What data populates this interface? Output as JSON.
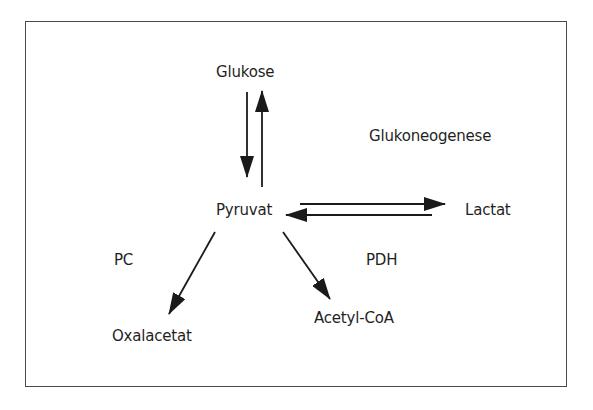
{
  "diagram": {
    "type": "metabolic-pathway",
    "nodes": {
      "glukose": "Glukose",
      "pyruvat": "Pyruvat",
      "lactat": "Lactat",
      "oxalacetat": "Oxalacetat",
      "acetyl_coa": "Acetyl-CoA"
    },
    "annotations": {
      "glukoneogenese": "Glukoneogenese",
      "pc": "PC",
      "pdh": "PDH"
    },
    "edges": [
      {
        "from": "Glukose",
        "to": "Pyruvat",
        "direction": "down"
      },
      {
        "from": "Pyruvat",
        "to": "Glukose",
        "direction": "up"
      },
      {
        "from": "Pyruvat",
        "to": "Lactat",
        "direction": "right"
      },
      {
        "from": "Lactat",
        "to": "Pyruvat",
        "direction": "left"
      },
      {
        "from": "Pyruvat",
        "to": "Oxalacetat",
        "enzyme": "PC"
      },
      {
        "from": "Pyruvat",
        "to": "Acetyl-CoA",
        "enzyme": "PDH"
      }
    ],
    "colors": {
      "stroke": "#1a1a1a",
      "text": "#1f1f1f",
      "frame": "#4a4a4a",
      "background": "#ffffff"
    }
  }
}
